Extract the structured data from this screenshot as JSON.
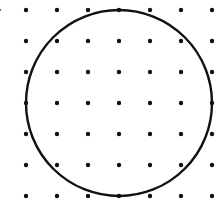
{
  "diagram": {
    "type": "dot-grid-with-circle",
    "width": 221,
    "height": 209,
    "background": "#ffffff",
    "grid": {
      "columns_x": [
        26,
        57,
        88,
        119,
        150,
        181,
        212
      ],
      "rows_y": [
        10,
        41,
        72,
        103,
        134,
        165,
        196
      ],
      "dot_radius": 2.2,
      "dot_color": "#111111",
      "extra_dots": [
        {
          "x": 0,
          "y": 10,
          "r": 1.2,
          "color": "#777777"
        }
      ]
    },
    "circle": {
      "cx": 119,
      "cy": 103,
      "r": 93,
      "stroke": "#111111",
      "stroke_width": 2.4
    }
  }
}
